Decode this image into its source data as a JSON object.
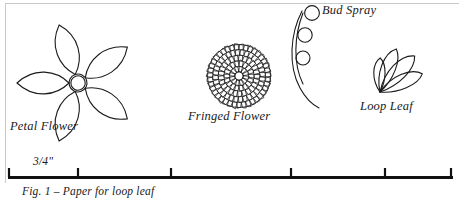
{
  "figure": {
    "caption": "Fig. 1  –  Paper for loop leaf",
    "page_background": "#ffffff",
    "ink_color": "#1a1a1a",
    "rule_color": "#c9c9c9"
  },
  "labels": {
    "petal_flower": "Petal Flower",
    "fringed_flower": "Fringed Flower",
    "bud_spray": "Bud Spray",
    "loop_leaf": "Loop Leaf"
  },
  "scale": {
    "value_label": "3/4\"",
    "units": "inches",
    "bar_start_x": 8,
    "bar_end_x": 453,
    "tick_positions": [
      8,
      78,
      171,
      291,
      385,
      450
    ],
    "tick_count": 6
  },
  "chart_data": {
    "type": "diagram",
    "title": "Fig. 1 – Paper for loop leaf",
    "shapes": [
      {
        "name": "Petal Flower",
        "kind": "five-petal-flower",
        "center": [
          78,
          83
        ],
        "core_radius": 9,
        "petal_count": 5,
        "petal_length": 52,
        "petal_width": 26,
        "rotation_deg": -18
      },
      {
        "name": "Fringed Flower",
        "kind": "fringed-disc",
        "center": [
          239,
          76
        ],
        "radius": 32,
        "fringe_rings": 5,
        "fringe_marks": 150
      },
      {
        "name": "Bud Spray",
        "kind": "curved-stem-with-buds",
        "stem_top": [
          301,
          12
        ],
        "stem_bottom": [
          318,
          108
        ],
        "bud_radius": 7,
        "buds": [
          [
            312,
            13
          ],
          [
            305,
            35
          ],
          [
            303,
            58
          ]
        ]
      },
      {
        "name": "Loop Leaf",
        "kind": "loop-fan",
        "base": [
          380,
          92
        ],
        "loop_count": 4,
        "loop_lengths": [
          34,
          46,
          50,
          46
        ],
        "loop_angles_deg": [
          -88,
          -68,
          -45,
          -22
        ]
      }
    ],
    "scale_bar": {
      "label": "3/4\"",
      "x_start": 8,
      "x_end": 453,
      "y": 176,
      "ticks": [
        8,
        78,
        171,
        291,
        385,
        450
      ]
    }
  }
}
